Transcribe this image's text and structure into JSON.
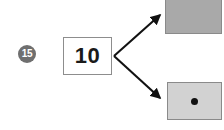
{
  "diagram": {
    "step_badge": {
      "label": "15",
      "icon": "numbered-step-circle",
      "fill_color": "#6f6f6f",
      "text_color": "#ffffff"
    },
    "source": {
      "name": "number-box",
      "value": "10",
      "border_color": "#8d8d8d",
      "fill_color": "#ffffff"
    },
    "arrows": [
      {
        "name": "arrow-to-top-tile",
        "icon": "arrow-up-right-icon",
        "from": [
          114,
          56
        ],
        "to": [
          163,
          13
        ],
        "color": "#111111"
      },
      {
        "name": "arrow-to-bottom-tile",
        "icon": "arrow-down-right-icon",
        "from": [
          114,
          56
        ],
        "to": [
          163,
          100
        ],
        "color": "#111111"
      }
    ],
    "targets": [
      {
        "name": "tile-top",
        "fill_color": "#a9a9a9",
        "border_color": "#8a8a8a",
        "dot_count": 0
      },
      {
        "name": "tile-bottom",
        "fill_color": "#d2d2d2",
        "border_color": "#8a8a8a",
        "dot_count": 1,
        "dot_color": "#111111"
      }
    ]
  }
}
